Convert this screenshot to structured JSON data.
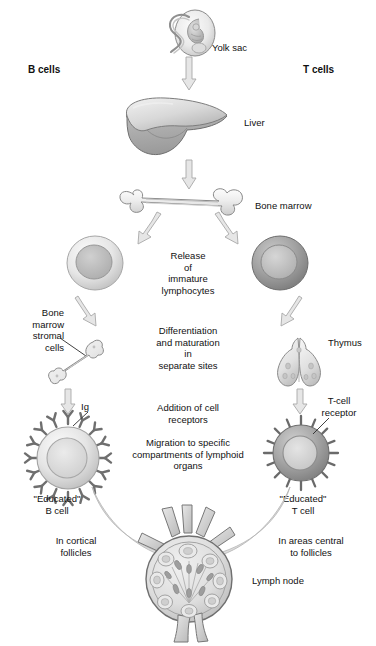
{
  "figure": {
    "background_color": "#ffffff",
    "ink_color": "#111111"
  },
  "columns": {
    "left_header": "B cells",
    "right_header": "T cells"
  },
  "organs": [
    {
      "key": "yolk_sac",
      "label": "Yolk sac",
      "fill": "#e8e8e8",
      "stroke": "#8b8b8b"
    },
    {
      "key": "liver",
      "label": "Liver",
      "fill": "#cfcfcf",
      "stroke": "#7d7d7d"
    },
    {
      "key": "bone_marrow",
      "label": "Bone marrow",
      "fill": "#ededed",
      "stroke": "#8a8a8a"
    },
    {
      "key": "stromal_bone",
      "label": "Bone\nmarrow\nstromal\ncells",
      "fill": "#ebebeb",
      "stroke": "#8a8a8a"
    },
    {
      "key": "thymus",
      "label": "Thymus",
      "fill": "#e4e4e4",
      "stroke": "#8a8a8a"
    },
    {
      "key": "lymph_node",
      "label": "Lymph node",
      "fill": "#dcdcdc",
      "stroke": "#6f6f6f"
    }
  ],
  "cells": [
    {
      "key": "immature_b",
      "label": "",
      "outer_fill": "#e3e3e3",
      "nucleus_fill": "#b9b9b9"
    },
    {
      "key": "immature_t",
      "label": "",
      "outer_fill": "#9e9e9e",
      "nucleus_fill": "#c2c2c2"
    },
    {
      "key": "educated_b",
      "label": "\"Educated\"\nB cell",
      "outer_fill": "#e0e0e0",
      "nucleus_fill": "#d2d2d2",
      "receptor_label": "Ig",
      "receptor_shape": "Y"
    },
    {
      "key": "educated_t",
      "label": "\"Educated\"\nT cell",
      "outer_fill": "#a6a6a6",
      "nucleus_fill": "#d8d8d8",
      "receptor_label": "T-cell\nreceptor",
      "receptor_shape": "spike"
    }
  ],
  "process_steps": [
    {
      "key": "release",
      "text": "Release\nof\nimmature\nlymphocytes"
    },
    {
      "key": "differentiation",
      "text": "Differentiation\nand maturation\nin\nseparate sites"
    },
    {
      "key": "receptors",
      "text": "Addition of cell\nreceptors"
    },
    {
      "key": "migration",
      "text": "Migration to specific\ncompartments of lymphoid\norgans"
    }
  ],
  "destinations": {
    "left": "In cortical\nfollicles",
    "right": "In areas central\nto follicles"
  }
}
